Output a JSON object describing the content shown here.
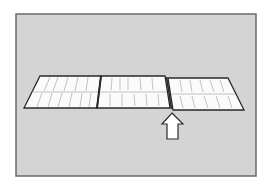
{
  "figure": {
    "description": "Three flat panels laid in a row in perspective; an arrow points to the joint between the middle and right panels",
    "background_color": "#d4d4d4",
    "frame_color": "#6a6a6a",
    "panel_fill": "#fbfbfb",
    "outline_color": "#2a2a2a",
    "panels": [
      {
        "id": "left",
        "label": ""
      },
      {
        "id": "middle",
        "label": ""
      },
      {
        "id": "right",
        "label": ""
      }
    ],
    "arrow": {
      "direction": "up",
      "target": "joint between middle and right panels",
      "label": ""
    }
  }
}
